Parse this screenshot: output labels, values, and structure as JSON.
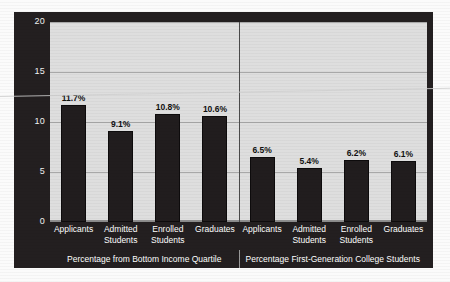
{
  "chart_data": {
    "type": "bar",
    "title": "",
    "xlabel": "",
    "ylabel": "",
    "ylim": [
      0,
      20
    ],
    "yticks": [
      0,
      5,
      10,
      15,
      20
    ],
    "ytick_labels": [
      "0",
      "5",
      "10",
      "15",
      "20"
    ],
    "grid": true,
    "legend": "none",
    "value_suffix": "%",
    "categories": [
      "Applicants",
      "Admitted\nStudents",
      "Enrolled\nStudents",
      "Graduates"
    ],
    "panels": [
      {
        "caption": "Percentage from Bottom Income Quartile",
        "categories": [
          "Applicants",
          "Admitted\nStudents",
          "Enrolled\nStudents",
          "Graduates"
        ],
        "values": [
          11.7,
          9.1,
          10.8,
          10.6
        ],
        "value_labels": [
          "11.7%",
          "9.1%",
          "10.8%",
          "10.6%"
        ]
      },
      {
        "caption": "Percentage First-Generation College Students",
        "categories": [
          "Applicants",
          "Admitted\nStudents",
          "Enrolled\nStudents",
          "Graduates"
        ],
        "values": [
          6.5,
          5.4,
          6.2,
          6.1
        ],
        "value_labels": [
          "6.5%",
          "5.4%",
          "6.2%",
          "6.1%"
        ]
      }
    ],
    "colors": {
      "bar": "#211d1e",
      "plot_background": "#dedede",
      "figure_background": "#231f20",
      "gridline": "#a8a8a8",
      "axis_text": "#f2f2f2",
      "value_text": "#111111"
    }
  }
}
